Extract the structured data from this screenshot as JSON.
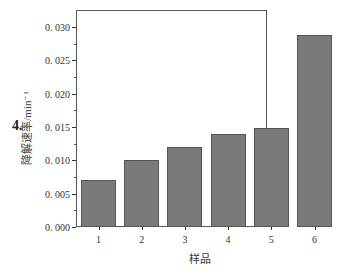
{
  "figure_label": "4.",
  "chart_data": {
    "type": "bar",
    "title": "",
    "xlabel": "样品",
    "ylabel": "降解速率/min⁻¹",
    "categories": [
      "1",
      "2",
      "3",
      "4",
      "5",
      "6"
    ],
    "values": [
      0.007,
      0.01,
      0.012,
      0.0139,
      0.0148,
      0.0288
    ],
    "ylim": [
      0,
      0.032
    ],
    "yticks": [
      "0.000",
      "0.005",
      "0.010",
      "0.015",
      "0.020",
      "0.025",
      "0.030"
    ],
    "grid": false,
    "legend": null,
    "bar_color": "#7a7a7a"
  }
}
